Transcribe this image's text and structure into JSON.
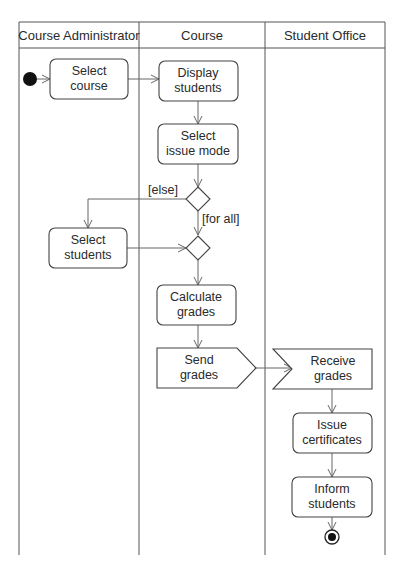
{
  "diagram": {
    "type": "uml-activity-diagram",
    "swimlanes": [
      {
        "id": "admin",
        "label": "Course Administrator"
      },
      {
        "id": "course",
        "label": "Course"
      },
      {
        "id": "office",
        "label": "Student Office"
      }
    ],
    "nodes": {
      "start": {
        "kind": "initial",
        "lane": "admin"
      },
      "select_course": {
        "kind": "action",
        "lane": "admin",
        "lines": [
          "Select",
          "course"
        ]
      },
      "display_students": {
        "kind": "action",
        "lane": "course",
        "lines": [
          "Display",
          "students"
        ]
      },
      "select_issue_mode": {
        "kind": "action",
        "lane": "course",
        "lines": [
          "Select",
          "issue mode"
        ]
      },
      "decision": {
        "kind": "decision",
        "lane": "course"
      },
      "merge": {
        "kind": "merge",
        "lane": "course"
      },
      "select_students": {
        "kind": "action",
        "lane": "admin",
        "lines": [
          "Select",
          "students"
        ]
      },
      "calculate_grades": {
        "kind": "action",
        "lane": "course",
        "lines": [
          "Calculate",
          "grades"
        ]
      },
      "send_grades": {
        "kind": "send-signal",
        "lane": "course",
        "lines": [
          "Send",
          "grades"
        ]
      },
      "receive_grades": {
        "kind": "accept-event",
        "lane": "office",
        "lines": [
          "Receive",
          "grades"
        ]
      },
      "issue_certificates": {
        "kind": "action",
        "lane": "office",
        "lines": [
          "Issue",
          "certificates"
        ]
      },
      "inform_students": {
        "kind": "action",
        "lane": "office",
        "lines": [
          "Inform",
          "students"
        ]
      },
      "end": {
        "kind": "final",
        "lane": "office"
      }
    },
    "guards": {
      "else": "[else]",
      "for_all": "[for all]"
    },
    "edges": [
      {
        "from": "start",
        "to": "select_course"
      },
      {
        "from": "select_course",
        "to": "display_students"
      },
      {
        "from": "display_students",
        "to": "select_issue_mode"
      },
      {
        "from": "select_issue_mode",
        "to": "decision"
      },
      {
        "from": "decision",
        "to": "select_students",
        "guard": "[else]"
      },
      {
        "from": "decision",
        "to": "merge",
        "guard": "[for all]"
      },
      {
        "from": "select_students",
        "to": "merge"
      },
      {
        "from": "merge",
        "to": "calculate_grades"
      },
      {
        "from": "calculate_grades",
        "to": "send_grades"
      },
      {
        "from": "send_grades",
        "to": "receive_grades"
      },
      {
        "from": "receive_grades",
        "to": "issue_certificates"
      },
      {
        "from": "issue_certificates",
        "to": "inform_students"
      },
      {
        "from": "inform_students",
        "to": "end"
      }
    ]
  }
}
